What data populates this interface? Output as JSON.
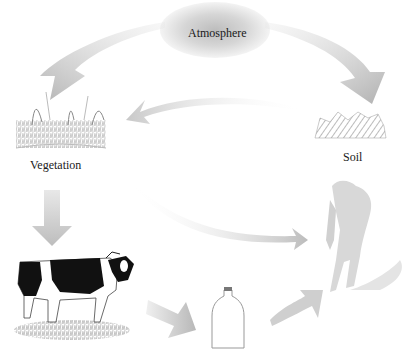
{
  "diagram": {
    "type": "cycle",
    "nodes": [
      {
        "id": "atmosphere",
        "label": "Atmosphere"
      },
      {
        "id": "vegetation",
        "label": "Vegetation"
      },
      {
        "id": "soil",
        "label": "Soil"
      },
      {
        "id": "cow",
        "label": ""
      },
      {
        "id": "milk",
        "label": ""
      },
      {
        "id": "human",
        "label": ""
      }
    ],
    "edges": [
      {
        "from": "atmosphere",
        "to": "vegetation"
      },
      {
        "from": "atmosphere",
        "to": "soil"
      },
      {
        "from": "soil",
        "to": "vegetation"
      },
      {
        "from": "vegetation",
        "to": "cow"
      },
      {
        "from": "vegetation",
        "to": "human"
      },
      {
        "from": "cow",
        "to": "milk"
      },
      {
        "from": "milk",
        "to": "human"
      }
    ]
  },
  "labels": {
    "atmosphere": "Atmosphere",
    "vegetation": "Vegetation",
    "soil": "Soil"
  },
  "colors": {
    "arrow": "#bdbdbd",
    "arrow_light": "#d9d9d9",
    "text": "#1a1a1a",
    "cow_black": "#111111"
  }
}
